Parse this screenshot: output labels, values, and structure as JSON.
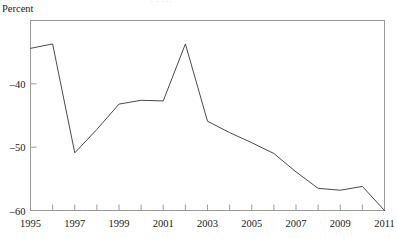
{
  "chart_data": {
    "type": "line",
    "title": "",
    "cropped_title_fragment": "· · ···",
    "xlabel": "",
    "ylabel": "Percent",
    "x": [
      1995,
      1996,
      1997,
      1998,
      1999,
      2000,
      2001,
      2002,
      2003,
      2004,
      2005,
      2006,
      2007,
      2008,
      2009,
      2010,
      2011
    ],
    "values": [
      -34.4,
      -33.7,
      -50.9,
      -47.2,
      -43.2,
      -42.6,
      -42.7,
      -33.7,
      -45.9,
      -47.7,
      -49.3,
      -51.0,
      -53.9,
      -56.5,
      -56.8,
      -56.2,
      -60.0
    ],
    "series": [
      {
        "name": "Percent",
        "values": [
          -34.4,
          -33.7,
          -50.9,
          -47.2,
          -43.2,
          -42.6,
          -42.7,
          -33.7,
          -45.9,
          -47.7,
          -49.3,
          -51.0,
          -53.9,
          -56.5,
          -56.8,
          -56.2,
          -60.0
        ]
      }
    ],
    "xlim": [
      1995,
      2011
    ],
    "ylim": [
      -60,
      -30
    ],
    "ytick_values": [
      -40,
      -50,
      -60
    ],
    "ytick_labels": [
      "–40",
      "–50",
      "–60"
    ],
    "xtick_values": [
      1995,
      1996,
      1997,
      1998,
      1999,
      2000,
      2001,
      2002,
      2003,
      2004,
      2005,
      2006,
      2007,
      2008,
      2009,
      2010,
      2011
    ],
    "xtick_labels_major": [
      "1995",
      "1997",
      "1999",
      "2001",
      "2003",
      "2005",
      "2007",
      "2009",
      "2011"
    ],
    "xtick_labels_major_values": [
      1995,
      1997,
      1999,
      2001,
      2003,
      2005,
      2007,
      2009,
      2011
    ],
    "grid": false,
    "legend": false,
    "legend_position": "none",
    "line_color": "#4a4a4a",
    "frame_color": "#9a9a9a",
    "background_color": "#ffffff"
  }
}
